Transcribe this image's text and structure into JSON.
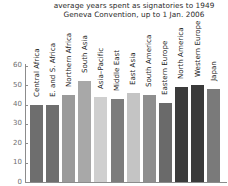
{
  "chart_data": {
    "type": "bar",
    "title": "average years spent as signatories to 1949\nGeneva Convention, up to 1 Jan. 2006",
    "xlabel": "",
    "ylabel": "",
    "ylim": [
      0,
      62
    ],
    "yticks": [
      0,
      10,
      20,
      30,
      40,
      50,
      60
    ],
    "grid": false,
    "legend": "none",
    "categories": [
      "Central Africa",
      "E. and S. Africa",
      "Northern Africa",
      "South Asia",
      "Asia–Pacific",
      "Middle East",
      "East Asia",
      "South America",
      "Eastern Europe",
      "North America",
      "Western Europe",
      "Japan"
    ],
    "values": [
      40,
      40,
      45,
      52,
      44,
      43,
      46,
      45,
      41,
      49,
      50,
      48
    ],
    "bar_colors": [
      "#6e6e6e",
      "#6e6e6e",
      "#9a9a9a",
      "#a8a8a8",
      "#cfcfcf",
      "#7c7c7c",
      "#c4c4c4",
      "#8e8e8e",
      "#6a6a6a",
      "#3b3b3b",
      "#3a3a3a",
      "#7a7a7a"
    ]
  },
  "axis": {
    "tick_labels": [
      "60",
      "50",
      "40",
      "30",
      "20",
      "10",
      "0"
    ]
  }
}
